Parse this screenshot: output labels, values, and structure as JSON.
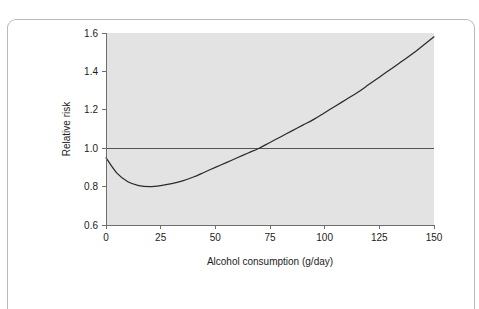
{
  "figure": {
    "frame_color": "#b9b9b9",
    "plot_background": "#e3e3e3",
    "curve_color": "#2b2b2b",
    "reference_line_color": "#555555",
    "axis_color": "#6d6d6d"
  },
  "chart_data": {
    "type": "line",
    "title": "",
    "subtitle": "",
    "xlabel": "Alcohol consumption (g/day)",
    "ylabel": "Relative risk",
    "xlim": [
      0,
      150
    ],
    "ylim": [
      0.6,
      1.6
    ],
    "xticks": [
      0,
      25,
      50,
      75,
      100,
      125,
      150
    ],
    "xtick_labels": [
      "0",
      "25",
      "50",
      "75",
      "100",
      "125",
      "150"
    ],
    "yticks": [
      0.6,
      0.8,
      1.0,
      1.2,
      1.4,
      1.6
    ],
    "ytick_labels": [
      "0.6",
      "0.8",
      "1.0",
      "1.2",
      "1.4",
      "1.6"
    ],
    "grid": false,
    "legend": null,
    "annotations": [],
    "reference_lines": [
      {
        "axis": "y",
        "value": 1.0,
        "label": ""
      }
    ],
    "series": [
      {
        "name": "Relative risk",
        "x": [
          0,
          5,
          10,
          15,
          20,
          25,
          30,
          35,
          40,
          45,
          50,
          55,
          60,
          65,
          70,
          75,
          80,
          85,
          90,
          95,
          100,
          105,
          110,
          115,
          120,
          125,
          130,
          135,
          140,
          145,
          150
        ],
        "values": [
          0.95,
          0.87,
          0.825,
          0.805,
          0.8,
          0.805,
          0.815,
          0.83,
          0.85,
          0.875,
          0.9,
          0.925,
          0.95,
          0.975,
          1.0,
          1.03,
          1.06,
          1.09,
          1.12,
          1.15,
          1.185,
          1.22,
          1.255,
          1.29,
          1.33,
          1.37,
          1.41,
          1.45,
          1.49,
          1.535,
          1.58
        ]
      }
    ],
    "key_points": {
      "value_at_zero": 0.95,
      "minimum_value": 0.8,
      "minimum_at_x": 20,
      "crosses_unity_at_x": 80,
      "value_at_max_x": 1.58
    }
  }
}
